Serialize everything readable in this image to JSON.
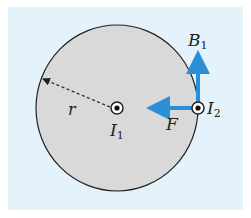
{
  "colors": {
    "background": "#e4f3fb",
    "disk_fill": "#d9d9d9",
    "disk_stroke": "#222222",
    "arrow": "#2a8fd6"
  },
  "labels": {
    "B": "B",
    "B_sub": "1",
    "I1": "I",
    "I1_sub": "1",
    "I2": "I",
    "I2_sub": "2",
    "F": "F",
    "r": "r"
  }
}
